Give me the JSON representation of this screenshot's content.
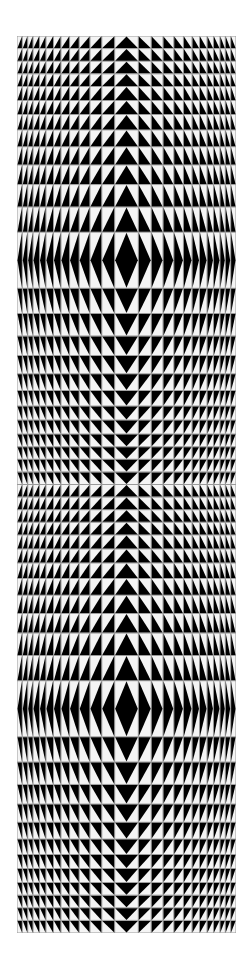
{
  "artwork": {
    "title": "Op-art triangle grid",
    "colors": {
      "black": "#000000",
      "white": "#f4f4f4",
      "grid": "#9a9a9a",
      "background": "#ffffff"
    },
    "bounds": {
      "x": 17,
      "y": 36,
      "width": 219,
      "height": 897
    },
    "columns_widths": [
      5,
      5,
      5,
      6,
      6,
      7,
      7,
      8,
      9,
      10,
      11,
      12,
      22,
      12,
      11,
      10,
      9,
      8,
      7,
      7,
      6,
      6,
      5,
      5,
      5
    ],
    "cycles": 2,
    "diamond_rows_y": [
      200,
      575
    ]
  }
}
